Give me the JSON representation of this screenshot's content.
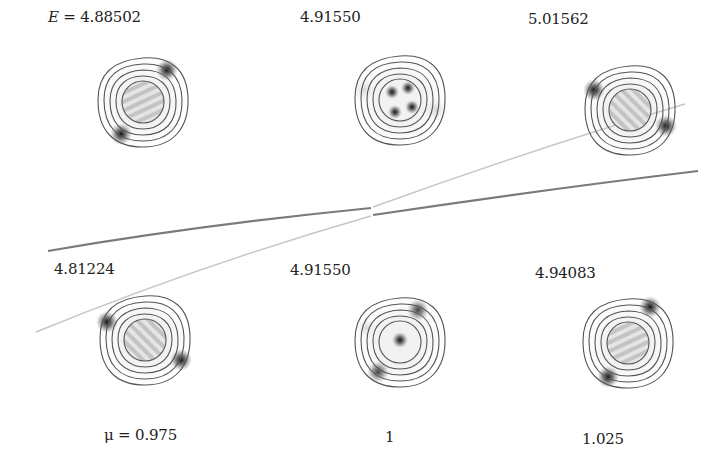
{
  "figure": {
    "energy_prefix": "E = ",
    "top_row": [
      {
        "energy": "4.88502",
        "pattern": "dipole-diagonal",
        "mu": "0.975"
      },
      {
        "energy": "4.91550",
        "pattern": "quadrupole-four-spots",
        "mu": "1"
      },
      {
        "energy": "5.01562",
        "pattern": "dipole-diagonal-flipped",
        "mu": "1.025"
      }
    ],
    "bottom_row": [
      {
        "energy": "4.81224",
        "pattern": "dipole-diagonal-flipped",
        "mu": "0.975"
      },
      {
        "energy": "4.91550",
        "pattern": "center-spot-ring",
        "mu": "1"
      },
      {
        "energy": "4.94083",
        "pattern": "dipole-diagonal",
        "mu": "1.025"
      }
    ],
    "mu_labels": [
      "μ = 0.975",
      "1",
      "1.025"
    ],
    "curves": {
      "dark_color": "#7a7a7a",
      "light_color": "#c4c4c4",
      "description": "avoided crossing of two energy branches near mu = 1"
    }
  }
}
